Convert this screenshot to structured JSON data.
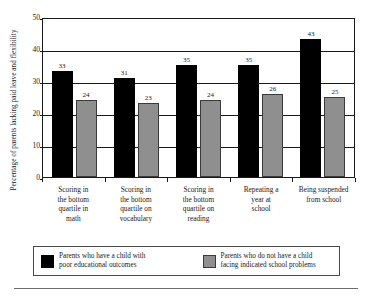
{
  "chart_data": {
    "type": "bar",
    "title": "",
    "xlabel": "",
    "ylabel": "Percentage of parents lacking paid leave and flexibility",
    "ylim": [
      0,
      50
    ],
    "yticks": [
      0,
      10,
      20,
      30,
      40,
      50
    ],
    "grid": true,
    "legend_position": "bottom",
    "categories": [
      "Scoring in the bottom quartile in math",
      "Scoring in the bottom quartile on vocabulary",
      "Scoring in the bottom quartile on reading",
      "Repeating a year at school",
      "Being suspended from school"
    ],
    "category_lines": [
      [
        "Scoring in",
        "the bottom",
        "quartile in",
        "math"
      ],
      [
        "Scoring in",
        "the bottom",
        "quartile on",
        "vocabulary"
      ],
      [
        "Scoring in",
        "the bottom",
        "quartile on",
        "reading"
      ],
      [
        "Repeating a",
        "year at",
        "school"
      ],
      [
        "Being suspended",
        "from school"
      ]
    ],
    "series": [
      {
        "name": "Parents who have a child with poor educational outcomes",
        "name_lines": [
          "Parents who have a child with",
          "poor educational outcomes"
        ],
        "color": "#000000",
        "values": [
          33,
          31,
          35,
          35,
          43
        ]
      },
      {
        "name": "Parents who do not have a child facing indicated school problems",
        "name_lines": [
          "Parents who do not have a child",
          "facing indicated school problems"
        ],
        "color": "#8f8f8f",
        "values": [
          24,
          23,
          24,
          26,
          25
        ]
      }
    ]
  }
}
